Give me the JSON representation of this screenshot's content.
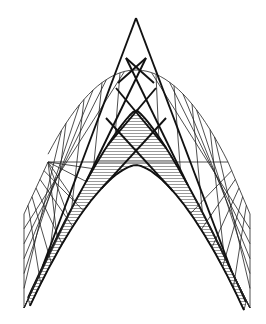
{
  "canvas": {
    "width": 266,
    "height": 324,
    "background": "#ffffff"
  },
  "diagram": {
    "stroke_color": "#111111",
    "hatch_color": "#555555",
    "peak": [
      136,
      18
    ],
    "outer_arch": {
      "top": [
        136,
        70
      ],
      "left_base": [
        48,
        162
      ],
      "right_base": [
        228,
        162
      ]
    },
    "base_line_y": 162,
    "left_edge": {
      "upper": [
        24,
        214
      ],
      "lower": [
        24,
        308
      ]
    },
    "right_edge": {
      "upper": [
        250,
        214
      ],
      "lower": [
        250,
        308
      ]
    },
    "inner_arch": {
      "top": [
        136,
        110
      ],
      "left_foot": [
        28,
        300
      ],
      "right_foot": [
        246,
        300
      ],
      "underside_top": [
        136,
        165
      ]
    }
  }
}
